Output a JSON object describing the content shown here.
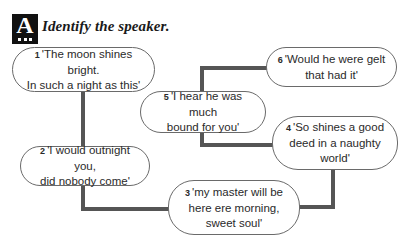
{
  "section": {
    "badge_letter": "A",
    "title": "Identify the speaker."
  },
  "quotes": [
    {
      "num": "1",
      "line1": "'The moon shines bright.",
      "line2": "In such a night as this'",
      "line3": ""
    },
    {
      "num": "2",
      "line1": "'I would outnight you,",
      "line2": "did nobody come'",
      "line3": ""
    },
    {
      "num": "3",
      "line1": "'my master will be",
      "line2": "here ere morning,",
      "line3": "sweet soul'"
    },
    {
      "num": "4",
      "line1": "'So shines a good",
      "line2": "deed in a naughty",
      "line3": "world'"
    },
    {
      "num": "5",
      "line1": "'I hear he was much",
      "line2": "bound for you'",
      "line3": ""
    },
    {
      "num": "6",
      "line1": "'Would he were gelt",
      "line2": "that had it'",
      "line3": ""
    }
  ],
  "colors": {
    "connector": "#555555",
    "bubble_border": "#6a6a6a",
    "badge": "#111111"
  }
}
